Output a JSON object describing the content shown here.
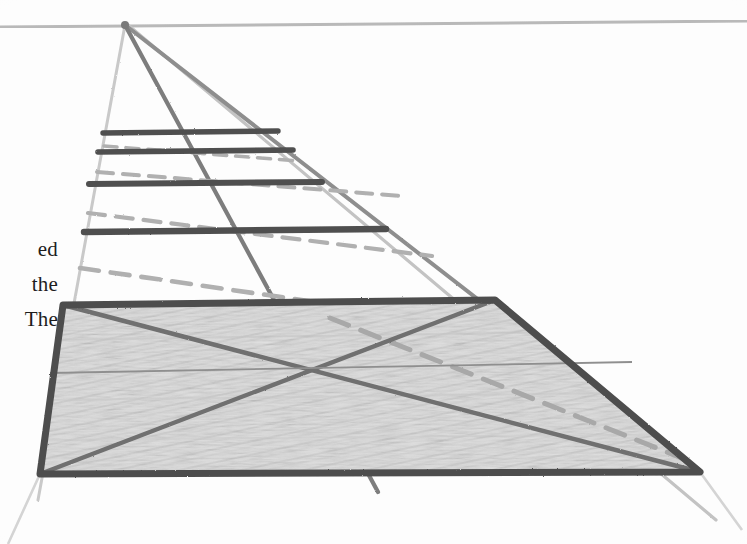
{
  "document": {
    "title": "Perspective Construction Sketch",
    "medium": "pencil on white paper",
    "paper_color": "#fdfdfd"
  },
  "margin_text": {
    "lines": [
      "ed",
      "the",
      "The"
    ],
    "note": "serif body text clipped by the left page edge"
  },
  "palette": {
    "ink_dark": "#555555",
    "ink_medium": "#8c8c8c",
    "ink_light": "#c3c3c3",
    "horizon": "#b9b9b9",
    "shading_fill": "#d9d9d9",
    "text": "#1d1d1d"
  },
  "geometry": {
    "vanishing_point": {
      "x": 125,
      "y": 25,
      "label": "vanishing point"
    },
    "horizon_line": {
      "x1": 0,
      "y1": 27,
      "x2": 747,
      "y2": 21
    },
    "converging_rays": [
      {
        "name": "ray-left-edge",
        "x1": 125,
        "y1": 25,
        "x2": 38,
        "y2": 500
      },
      {
        "name": "ray-center-steep",
        "x1": 125,
        "y1": 25,
        "x2": 378,
        "y2": 492
      },
      {
        "name": "ray-diagonal-mid",
        "x1": 125,
        "y1": 25,
        "x2": 700,
        "y2": 472
      },
      {
        "name": "ray-right-edge",
        "x1": 128,
        "y1": 25,
        "x2": 716,
        "y2": 520
      }
    ],
    "rungs": [
      {
        "name": "rung-1",
        "x1": 103,
        "y1": 133,
        "x2": 278,
        "y2": 131
      },
      {
        "name": "rung-2",
        "x1": 98,
        "y1": 152,
        "x2": 293,
        "y2": 150
      },
      {
        "name": "rung-3",
        "x1": 89,
        "y1": 184,
        "x2": 322,
        "y2": 182
      },
      {
        "name": "rung-4",
        "x1": 84,
        "y1": 232,
        "x2": 386,
        "y2": 229
      }
    ],
    "dashed_diagonals": [
      {
        "name": "dash-1",
        "x1": 104,
        "y1": 146,
        "x2": 300,
        "y2": 160
      },
      {
        "name": "dash-2",
        "x1": 97,
        "y1": 172,
        "x2": 400,
        "y2": 195
      },
      {
        "name": "dash-3",
        "x1": 88,
        "y1": 213,
        "x2": 430,
        "y2": 255
      },
      {
        "name": "dash-4",
        "x1": 80,
        "y1": 270,
        "x2": 520,
        "y2": 330
      },
      {
        "name": "dash-5",
        "x1": 330,
        "y1": 320,
        "x2": 690,
        "y2": 460
      }
    ],
    "shaded_quad": {
      "name": "shaded-ground-plane",
      "points": "63,305 495,300 700,472 40,474",
      "fill": "#d9d9d9",
      "border": "#4d4d4d",
      "border_width": 7
    },
    "quad_diagonals": [
      {
        "name": "quad-diagonal-a",
        "x1": 63,
        "y1": 305,
        "x2": 700,
        "y2": 472
      },
      {
        "name": "quad-diagonal-b",
        "x1": 495,
        "y1": 300,
        "x2": 40,
        "y2": 474
      }
    ],
    "quad_midline": {
      "name": "quad-horizontal-midline",
      "x1": 52,
      "y1": 372,
      "x2": 632,
      "y2": 362
    },
    "faint_extensions": [
      {
        "name": "extension-bottom-left",
        "x1": 40,
        "y1": 474,
        "x2": 8,
        "y2": 544
      },
      {
        "name": "extension-bottom-right",
        "x1": 700,
        "y1": 472,
        "x2": 740,
        "y2": 528
      }
    ]
  }
}
